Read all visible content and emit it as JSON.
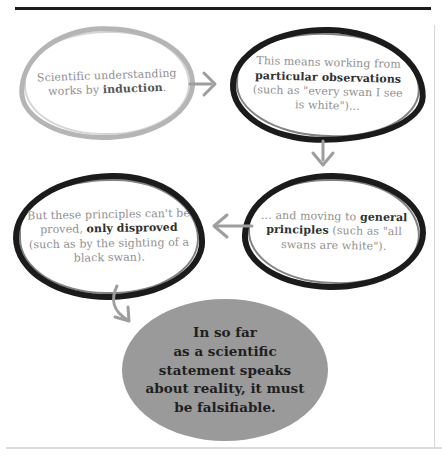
{
  "diagram": {
    "colors": {
      "sketch_gray": "#b5b5b5",
      "sketch_black": "#1b1b1b",
      "text_gray": "#8f8f8f",
      "text_bold_dark": "#303030",
      "arrow_gray": "#9e9e9e",
      "conclusion_fill": "#9a9a9a",
      "conclusion_text": "#1f1f1f",
      "rule_dark": "#1c1c1c",
      "rule_light": "#d8d8d8"
    },
    "nodes": {
      "induction": {
        "parts": [
          "Scientific understanding works by ",
          "induction",
          "."
        ]
      },
      "particular_observations": {
        "parts": [
          "This means working from ",
          "particular observations",
          " (such as \"every swan I see is white\")..."
        ]
      },
      "general_principles": {
        "parts": [
          "... and moving to ",
          "general principles",
          " (such as \"all swans are white\")."
        ]
      },
      "only_disproved": {
        "parts": [
          "But these principles can't be proved, ",
          "only disproved",
          " (such as by the sighting of a black swan)."
        ]
      },
      "conclusion": {
        "lines": [
          "In so far",
          "as a scientific",
          "statement speaks",
          "about reality, it must",
          "be falsifiable."
        ]
      }
    }
  }
}
